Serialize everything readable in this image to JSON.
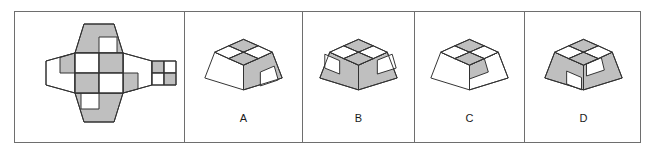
{
  "puzzle": {
    "type": "net-folding-spatial-reasoning",
    "colors": {
      "gray_fill": "#bfbfbf",
      "white_fill": "#ffffff",
      "stroke": "#333333",
      "frame_stroke": "#6e6e6e",
      "label_color": "#1a1a1a",
      "background": "#ffffff"
    },
    "frame": {
      "x": 14,
      "y": 11,
      "width": 627,
      "height": 132
    },
    "panels": [
      {
        "id": "prompt",
        "name": "net-panel",
        "x": 0,
        "width": 169,
        "label": ""
      },
      {
        "id": "A",
        "name": "option-panel-a",
        "x": 169,
        "width": 118,
        "label": "A"
      },
      {
        "id": "B",
        "name": "option-panel-b",
        "x": 287,
        "width": 112,
        "label": "B"
      },
      {
        "id": "C",
        "name": "option-panel-c",
        "x": 399,
        "width": 110,
        "label": "C"
      },
      {
        "id": "D",
        "name": "option-panel-d",
        "x": 509,
        "width": 118,
        "label": "D"
      }
    ],
    "net": {
      "description": "Unfolded net of a truncated pyramid (frustum): a central square top face surrounded by four trapezoidal side flaps, plus a square base face attached to the right flap.",
      "faces": [
        {
          "name": "top-square",
          "shape": "square",
          "pattern_2x2": [
            "white",
            "gray",
            "gray",
            "white"
          ]
        },
        {
          "name": "upper-trapezoid",
          "shape": "trapezoid",
          "base_fill": "gray",
          "inset_square": {
            "position": "bottom-right",
            "fill": "white"
          }
        },
        {
          "name": "lower-trapezoid",
          "shape": "trapezoid",
          "base_fill": "gray",
          "inset_square": {
            "position": "top-left",
            "fill": "white"
          }
        },
        {
          "name": "left-trapezoid",
          "shape": "trapezoid",
          "base_fill": "white",
          "inset_square": {
            "position": "top-left",
            "fill": "gray"
          }
        },
        {
          "name": "right-trapezoid",
          "shape": "trapezoid",
          "base_fill": "white",
          "inset_square": {
            "position": "bottom-left",
            "fill": "gray"
          }
        },
        {
          "name": "base-square",
          "shape": "square",
          "pattern_2x2": [
            "gray",
            "white",
            "white",
            "gray"
          ]
        }
      ]
    },
    "options": [
      {
        "id": "A",
        "label": "A",
        "solid": "truncated-pyramid",
        "top_face_pattern_2x2": [
          "gray",
          "white",
          "white",
          "gray"
        ],
        "left_face": {
          "base_fill": "white",
          "inset_square": null
        },
        "right_face": {
          "base_fill": "gray",
          "inset_square": {
            "position": "bottom-right",
            "fill": "white"
          }
        }
      },
      {
        "id": "B",
        "label": "B",
        "solid": "truncated-pyramid",
        "top_face_pattern_2x2": [
          "gray",
          "white",
          "white",
          "gray"
        ],
        "left_face": {
          "base_fill": "gray",
          "inset_square": {
            "position": "top-left",
            "fill": "white"
          }
        },
        "right_face": {
          "base_fill": "gray",
          "inset_square": {
            "position": "top-right",
            "fill": "white"
          }
        }
      },
      {
        "id": "C",
        "label": "C",
        "solid": "truncated-pyramid",
        "top_face_pattern_2x2": [
          "gray",
          "white",
          "white",
          "gray"
        ],
        "left_face": {
          "base_fill": "white",
          "inset_square": null
        },
        "right_face": {
          "base_fill": "white",
          "inset_square": {
            "position": "top-left",
            "fill": "gray"
          }
        }
      },
      {
        "id": "D",
        "label": "D",
        "solid": "truncated-pyramid",
        "top_face_pattern_2x2": [
          "gray",
          "white",
          "white",
          "gray"
        ],
        "left_face": {
          "base_fill": "gray",
          "inset_square": {
            "position": "bottom-right",
            "fill": "white"
          }
        },
        "right_face": {
          "base_fill": "gray",
          "inset_square": {
            "position": "bottom-left",
            "fill": "white"
          }
        }
      }
    ]
  }
}
